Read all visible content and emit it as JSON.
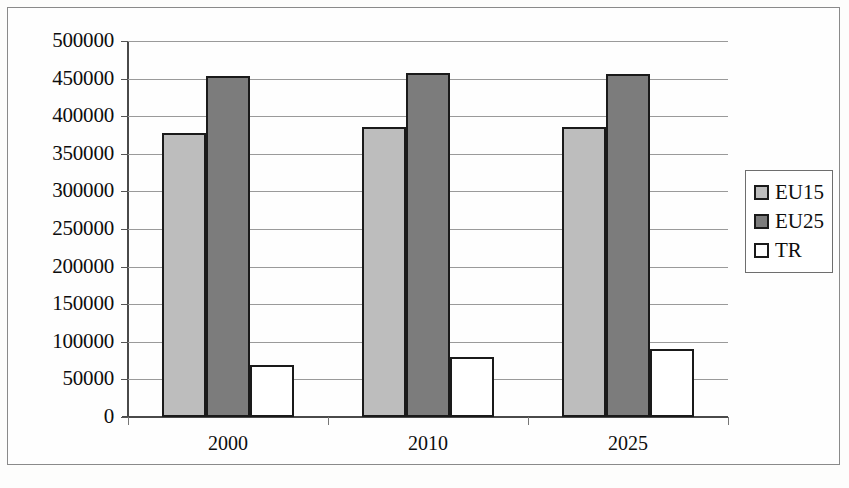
{
  "chart_data": {
    "type": "bar",
    "title": "",
    "subtitle": "",
    "xlabel": "",
    "ylabel": "",
    "categories": [
      "2000",
      "2010",
      "2025"
    ],
    "series": [
      {
        "name": "EU15",
        "color": "#bdbdbd",
        "values": [
          378000,
          385000,
          386000
        ]
      },
      {
        "name": "EU25",
        "color": "#7c7c7c",
        "values": [
          453000,
          458000,
          456000
        ]
      },
      {
        "name": "TR",
        "color": "#ffffff",
        "values": [
          69000,
          80000,
          91000
        ]
      }
    ],
    "ylim": [
      0,
      500000
    ],
    "ytick_step": 50000,
    "ytick_labels": [
      "500000",
      "450000",
      "400000",
      "350000",
      "300000",
      "250000",
      "200000",
      "150000",
      "100000",
      "50000",
      "0"
    ],
    "ytick_values": [
      500000,
      450000,
      400000,
      350000,
      300000,
      250000,
      200000,
      150000,
      100000,
      50000,
      0
    ],
    "grid": true,
    "grid_axis": "y",
    "legend_position": "right",
    "legend_entries": [
      "EU15",
      "EU25",
      "TR"
    ]
  },
  "frame": {
    "border_color": "#8a8a8a",
    "background": "#fefefe"
  }
}
